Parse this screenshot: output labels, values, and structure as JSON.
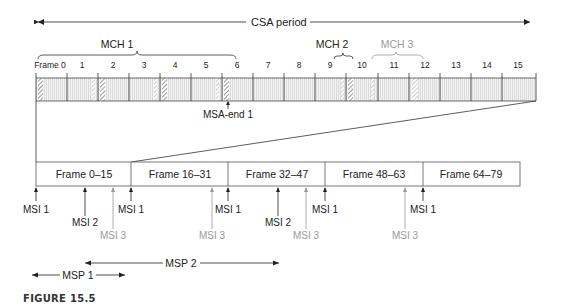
{
  "figure": {
    "caption": "FIGURE 15.5",
    "csa_label": "CSA period",
    "top_ruler": {
      "frame_labels": [
        "Frame 0",
        "1",
        "2",
        "3",
        "4",
        "5",
        "6",
        "7",
        "8",
        "9",
        "10",
        "11",
        "12",
        "13",
        "14",
        "15"
      ],
      "mch_groups": [
        {
          "label": "MCH 1",
          "from_frame": 0,
          "to_frame": 6,
          "color": "#222222"
        },
        {
          "label": "MCH 2",
          "from_frame": 9,
          "to_frame": 10,
          "color": "#222222"
        },
        {
          "label": "MCH 3",
          "from_frame": 10,
          "to_frame": 12,
          "color": "#9a9a9a"
        }
      ],
      "msa_end_label": "MSA-end 1"
    },
    "bottom_bar": {
      "frames": [
        "Frame 0–15",
        "Frame 16–31",
        "Frame 32–47",
        "Frame 48–63",
        "Frame 64–79"
      ]
    },
    "msi_markers": [
      {
        "label": "MSI 1",
        "x": 36,
        "color": "#222222",
        "row": 1
      },
      {
        "label": "MSI 2",
        "x": 85,
        "color": "#222222",
        "row": 2
      },
      {
        "label": "MSI 3",
        "x": 113,
        "color": "#9a9a9a",
        "row": 3
      },
      {
        "label": "MSI 1",
        "x": 131,
        "color": "#222222",
        "row": 1
      },
      {
        "label": "MSI 3",
        "x": 212,
        "color": "#9a9a9a",
        "row": 3
      },
      {
        "label": "MSI 1",
        "x": 228,
        "color": "#222222",
        "row": 1
      },
      {
        "label": "MSI 2",
        "x": 278,
        "color": "#222222",
        "row": 2
      },
      {
        "label": "MSI 3",
        "x": 306,
        "color": "#9a9a9a",
        "row": 3
      },
      {
        "label": "MSI 1",
        "x": 325,
        "color": "#222222",
        "row": 1
      },
      {
        "label": "MSI 3",
        "x": 405,
        "color": "#9a9a9a",
        "row": 3
      },
      {
        "label": "MSI 1",
        "x": 423,
        "color": "#222222",
        "row": 1
      }
    ],
    "msp": [
      {
        "label": "MSP 2"
      },
      {
        "label": "MSP 1"
      }
    ]
  }
}
